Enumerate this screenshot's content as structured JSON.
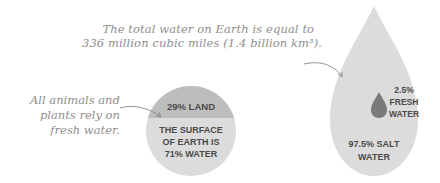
{
  "annotations": {
    "total_water": {
      "line1": "The total water on Earth is equal to",
      "line2": "336 million cubic miles (1.4 billion km³)."
    },
    "fresh_water": {
      "line1": "All animals and",
      "line2": "plants rely on",
      "line3": "fresh water."
    }
  },
  "earth_circle": {
    "land_label": "29% LAND",
    "water_line1": "THE SURFACE",
    "water_line2": "OF EARTH IS",
    "water_line3": "71% WATER",
    "land_pct": 29,
    "water_pct": 71
  },
  "water_drop": {
    "fresh_line1": "2.5%",
    "fresh_line2": "FRESH",
    "fresh_line3": "WATER",
    "salt_line1": "97.5% SALT",
    "salt_line2": "WATER",
    "fresh_pct": 2.5,
    "salt_pct": 97.5
  },
  "colors": {
    "light_gray": "#dcdcdc",
    "mid_gray": "#bdbdbd",
    "dark_drop": "#7a7a7a",
    "text_bold": "#4a4a4a",
    "text_hand": "#8e8e8e"
  }
}
